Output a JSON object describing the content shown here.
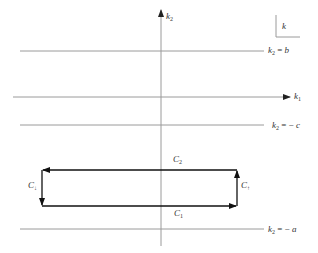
{
  "diagram": {
    "axes": {
      "vertical": {
        "label": "k",
        "subscript": "2"
      },
      "horizontal": {
        "label": "k",
        "subscript": "1"
      }
    },
    "corner_box": {
      "label": "k"
    },
    "lines": [
      {
        "id": "k2-eq-b",
        "var": "k",
        "sub": "2",
        "op": "=",
        "value": "b"
      },
      {
        "id": "k2-eq-minus-c",
        "var": "k",
        "sub": "2",
        "op": "= −",
        "value": "c"
      },
      {
        "id": "k2-eq-minus-a",
        "var": "k",
        "sub": "2",
        "op": "= −",
        "value": "a"
      }
    ],
    "contour": [
      {
        "id": "C1",
        "label": "C",
        "sub": "1"
      },
      {
        "id": "C2",
        "label": "C",
        "sub": "2"
      },
      {
        "id": "Cup",
        "label": "C",
        "sub": "↑"
      },
      {
        "id": "Cdown",
        "label": "C",
        "sub": "↓"
      }
    ],
    "colors": {
      "line": "#9a9a9a",
      "contour": "#111111",
      "text": "#333333"
    }
  }
}
